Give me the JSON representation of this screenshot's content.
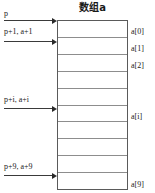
{
  "diagram": {
    "title": "数组a",
    "box": {
      "cell_count": 10
    },
    "index_labels": [
      {
        "text": "a[0]",
        "cell": 0
      },
      {
        "text": "a[1]",
        "cell": 1
      },
      {
        "text": "a[2]",
        "cell": 2
      },
      {
        "text": "a[i]",
        "cell": 5
      },
      {
        "text": "a[9]",
        "cell": 9
      }
    ],
    "pointers": [
      {
        "text": "p",
        "target_cell_edge": 0
      },
      {
        "text": "p+1, a+1",
        "target_cell_edge": 1
      },
      {
        "text": "p+i, a+i",
        "target_cell_edge": 5
      },
      {
        "text": "p+9, a+9",
        "target_cell_edge": 9
      }
    ],
    "colors": {
      "box_border": "#5a5a5a",
      "cell_divider": "#8d8d8d",
      "arrow": "#2a2a2a",
      "text": "#1a1a1a",
      "background": "#ffffff"
    }
  }
}
